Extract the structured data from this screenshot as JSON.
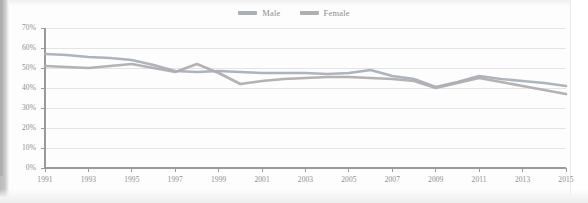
{
  "chart_data": {
    "type": "line",
    "title": "",
    "xlabel": "",
    "ylabel": "",
    "ylim": [
      0,
      70
    ],
    "ytick_values": [
      0,
      10,
      20,
      30,
      40,
      50,
      60,
      70
    ],
    "ytick_labels": [
      "0%",
      "10%",
      "20%",
      "30%",
      "40%",
      "50%",
      "60%",
      "70%"
    ],
    "grid": true,
    "legend_position": "top-center",
    "x": [
      1991,
      1992,
      1993,
      1994,
      1995,
      1996,
      1997,
      1998,
      1999,
      2000,
      2001,
      2002,
      2003,
      2004,
      2005,
      2006,
      2007,
      2008,
      2009,
      2010,
      2011,
      2012,
      2013,
      2014,
      2015
    ],
    "xtick_labels": [
      "1991",
      "1993",
      "1995",
      "1997",
      "1999",
      "2001",
      "2003",
      "2005",
      "2007",
      "2009",
      "2011",
      "2013",
      "2015"
    ],
    "xtick_values": [
      1991,
      1993,
      1995,
      1997,
      1999,
      2001,
      2003,
      2005,
      2007,
      2009,
      2011,
      2013,
      2015
    ],
    "series": [
      {
        "name": "Male",
        "color": "#a9b0b8",
        "values": [
          57,
          56.5,
          55.5,
          55,
          54,
          51.5,
          48.5,
          48,
          48.5,
          48,
          47.5,
          47.5,
          47.5,
          47,
          47.5,
          49,
          46,
          44.5,
          40.5,
          43,
          46,
          44.5,
          43.5,
          42.5,
          41
        ]
      },
      {
        "name": "Female",
        "color": "#b0aeb0",
        "values": [
          51,
          50.5,
          50,
          51,
          52,
          50,
          48,
          52,
          47.5,
          42,
          43.5,
          44.5,
          45,
          45.5,
          45.5,
          45,
          44.5,
          43.5,
          40,
          42.5,
          45,
          43,
          41,
          39,
          37
        ]
      }
    ]
  },
  "legend": {
    "items": [
      {
        "label": "Male",
        "color": "#a9b0b8"
      },
      {
        "label": "Female",
        "color": "#b0aeb0"
      }
    ]
  },
  "axes": {
    "axis_line_color": "#9a9a9a",
    "grid_color": "#e4e4e4",
    "tick_label_color": "#8f8f8f"
  }
}
